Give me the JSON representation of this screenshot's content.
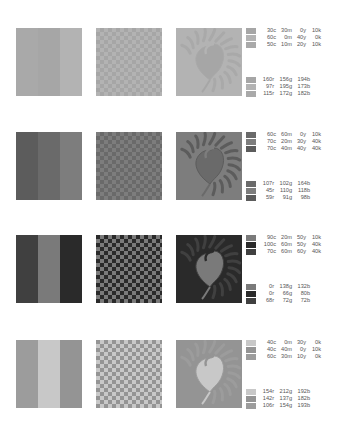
{
  "sets": [
    {
      "tones": [
        "#a6a6a6",
        "#b3b3b3",
        "#a9a9a9"
      ],
      "cmyk": [
        {
          "c": "30c",
          "m": "30m",
          "y": "0y",
          "k": "10k"
        },
        {
          "c": "60c",
          "m": "0m",
          "y": "40y",
          "k": "0k"
        },
        {
          "c": "50c",
          "m": "10m",
          "y": "20y",
          "k": "10k"
        }
      ],
      "rgb": [
        {
          "r": "160r",
          "g": "156g",
          "b": "194b",
          "hex": "#a09cc2"
        },
        {
          "r": "97r",
          "g": "195g",
          "b": "173b",
          "hex": "#61c3ad"
        },
        {
          "r": "115r",
          "g": "172g",
          "b": "182b",
          "hex": "#73acb6"
        }
      ]
    },
    {
      "tones": [
        "#6a6a6a",
        "#7d7d7d",
        "#5c5c5c"
      ],
      "cmyk": [
        {
          "c": "60c",
          "m": "60m",
          "y": "0y",
          "k": "10k"
        },
        {
          "c": "70c",
          "m": "20m",
          "y": "30y",
          "k": "40k"
        },
        {
          "c": "70c",
          "m": "40m",
          "y": "40y",
          "k": "40k"
        }
      ],
      "rgb": [
        {
          "r": "107r",
          "g": "102g",
          "b": "164b",
          "hex": "#6b66a4"
        },
        {
          "r": "45r",
          "g": "110g",
          "b": "118b",
          "hex": "#2d6e76"
        },
        {
          "r": "59r",
          "g": "91g",
          "b": "98b",
          "hex": "#3b5b62"
        }
      ]
    },
    {
      "tones": [
        "#7a7a7a",
        "#2a2a2a",
        "#404040"
      ],
      "cmyk": [
        {
          "c": "90c",
          "m": "20m",
          "y": "50y",
          "k": "10k"
        },
        {
          "c": "100c",
          "m": "60m",
          "y": "50y",
          "k": "40k"
        },
        {
          "c": "70c",
          "m": "60m",
          "y": "60y",
          "k": "40k"
        }
      ],
      "rgb": [
        {
          "r": "0r",
          "g": "138g",
          "b": "132b",
          "hex": "#008a84"
        },
        {
          "r": "0r",
          "g": "66g",
          "b": "80b",
          "hex": "#004250"
        },
        {
          "r": "68r",
          "g": "72g",
          "b": "72b",
          "hex": "#444848"
        }
      ]
    },
    {
      "tones": [
        "#c8c8c8",
        "#949494",
        "#9c9c9c"
      ],
      "cmyk": [
        {
          "c": "40c",
          "m": "0m",
          "y": "30y",
          "k": "0k"
        },
        {
          "c": "40c",
          "m": "40m",
          "y": "0y",
          "k": "10k"
        },
        {
          "c": "60c",
          "m": "30m",
          "y": "10y",
          "k": "0k"
        }
      ],
      "rgb": [
        {
          "r": "154r",
          "g": "212g",
          "b": "192b",
          "hex": "#9ad4c0"
        },
        {
          "r": "142r",
          "g": "137g",
          "b": "182b",
          "hex": "#8e89b6"
        },
        {
          "r": "106r",
          "g": "154g",
          "b": "193b",
          "hex": "#6a9ac1"
        }
      ]
    }
  ]
}
